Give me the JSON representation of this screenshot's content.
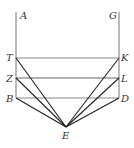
{
  "figure": {
    "type": "geometric-diagram",
    "colors": {
      "background": "#ffffff",
      "frame_line": "#777777",
      "ray_line": "#222222",
      "label": "#333333"
    },
    "points": {
      "A": {
        "label": "A",
        "x": 16,
        "y": 12
      },
      "G": {
        "label": "G",
        "x": 119,
        "y": 12
      },
      "T": {
        "label": "T",
        "x": 16,
        "y": 58
      },
      "K": {
        "label": "K",
        "x": 119,
        "y": 58
      },
      "Z": {
        "label": "Z",
        "x": 16,
        "y": 78
      },
      "L": {
        "label": "L",
        "x": 119,
        "y": 78
      },
      "B": {
        "label": "B",
        "x": 16,
        "y": 98
      },
      "D": {
        "label": "D",
        "x": 119,
        "y": 98
      },
      "E": {
        "label": "E",
        "x": 66,
        "y": 127
      }
    },
    "segments": [
      {
        "from": "A",
        "to": "B",
        "style": "frame"
      },
      {
        "from": "G",
        "to": "D",
        "style": "frame"
      },
      {
        "from": "T",
        "to": "K",
        "style": "frame"
      },
      {
        "from": "Z",
        "to": "L",
        "style": "frame"
      },
      {
        "from": "B",
        "to": "D",
        "style": "frame"
      },
      {
        "from": "T",
        "to": "E",
        "style": "ray"
      },
      {
        "from": "Z",
        "to": "E",
        "style": "ray"
      },
      {
        "from": "B",
        "to": "E",
        "style": "ray"
      },
      {
        "from": "K",
        "to": "E",
        "style": "ray"
      },
      {
        "from": "L",
        "to": "E",
        "style": "ray"
      },
      {
        "from": "D",
        "to": "E",
        "style": "ray"
      }
    ],
    "labels": {
      "A": "A",
      "G": "G",
      "T": "T",
      "K": "K",
      "Z": "Z",
      "L": "L",
      "B": "B",
      "D": "D",
      "E": "E"
    }
  }
}
